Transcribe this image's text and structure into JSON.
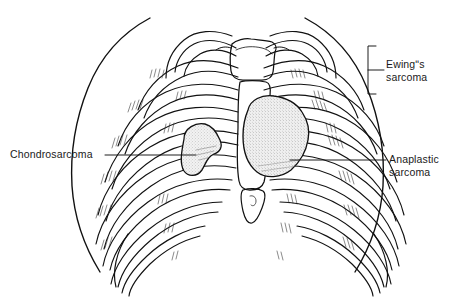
{
  "figure": {
    "kind": "anatomical-line-drawing",
    "background_color": "#ffffff",
    "ink_color": "#111111"
  },
  "labels": {
    "chondrosarcoma": "Chondrosarcoma",
    "ewing": "Ewingʺs\nsarcoma",
    "anaplastic": "Anaplastic\nsarcoma"
  },
  "annotations": {
    "chondrosarcoma_leader": "leader-line-left",
    "anaplastic_leader": "leader-line-right",
    "ewing_bracket": "bracket-right"
  },
  "tumors": [
    {
      "name": "chondrosarcoma-mass",
      "side": "left",
      "fill": "#efefef"
    },
    {
      "name": "anaplastic-sarcoma-mass",
      "side": "right",
      "fill": "#ededed"
    }
  ]
}
